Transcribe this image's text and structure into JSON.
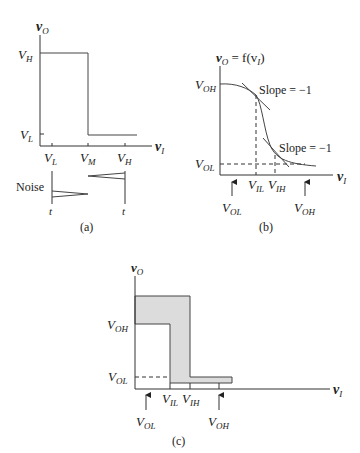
{
  "panel_a": {
    "caption": "(a)",
    "y_axis_label": "v",
    "y_axis_sub": "O",
    "x_axis_label": "v",
    "x_axis_sub": "I",
    "y_ticks": [
      {
        "main": "V",
        "sub": "H"
      },
      {
        "main": "V",
        "sub": "L"
      }
    ],
    "x_ticks": [
      {
        "main": "V",
        "sub": "L"
      },
      {
        "main": "V",
        "sub": "M"
      },
      {
        "main": "V",
        "sub": "H"
      }
    ],
    "noise_label": "Noise",
    "time_label_1": "t",
    "time_label_2": "t"
  },
  "panel_b": {
    "caption": "(b)",
    "y_axis_label": "v",
    "y_axis_sub": "O",
    "y_axis_eq": " = f(v",
    "y_axis_eq_sub": "I",
    "y_axis_eq_close": ")",
    "x_axis_label": "v",
    "x_axis_sub": "I",
    "y_ticks": [
      {
        "main": "V",
        "sub": "OH"
      },
      {
        "main": "V",
        "sub": "OL"
      }
    ],
    "x_ticks": [
      {
        "main": "V",
        "sub": "IL"
      },
      {
        "main": "V",
        "sub": "IH"
      }
    ],
    "slope_label_1": "Slope = −1",
    "slope_label_2": "Slope = −1",
    "arrow_labels": [
      {
        "main": "V",
        "sub": "OL"
      },
      {
        "main": "V",
        "sub": "OH"
      }
    ]
  },
  "panel_c": {
    "caption": "(c)",
    "y_axis_label": "v",
    "y_axis_sub": "O",
    "x_axis_label": "v",
    "x_axis_sub": "I",
    "y_ticks": [
      {
        "main": "V",
        "sub": "OH"
      },
      {
        "main": "V",
        "sub": "OL"
      }
    ],
    "x_ticks": [
      {
        "main": "V",
        "sub": "IL"
      },
      {
        "main": "V",
        "sub": "IH"
      }
    ],
    "arrow_labels": [
      {
        "main": "V",
        "sub": "OL"
      },
      {
        "main": "V",
        "sub": "OH"
      }
    ],
    "shade_color": "#dcdcdc"
  }
}
